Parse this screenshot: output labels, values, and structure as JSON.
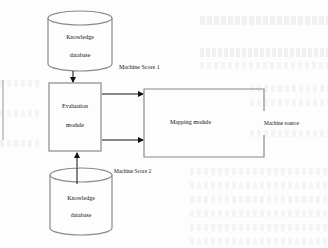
{
  "diagram": {
    "nodes": {
      "knowledge_db_top": {
        "line1": "Knowledge",
        "line2": "database",
        "shape": "cylinder"
      },
      "evaluation_module": {
        "line1": "Evaluation",
        "line2": "module",
        "shape": "rectangle"
      },
      "mapping_module": {
        "label": "Mapping module",
        "shape": "open-rectangle"
      },
      "knowledge_db_bottom": {
        "line1": "Knowledge",
        "line2": "database",
        "shape": "cylinder"
      }
    },
    "edge_labels": {
      "score1": "Machine Score 1",
      "score2": "Machine Score 2",
      "source": "Machine source"
    },
    "edges": [
      {
        "from": "knowledge_db_top",
        "to": "evaluation_module"
      },
      {
        "from": "knowledge_db_bottom",
        "to": "evaluation_module"
      },
      {
        "from": "evaluation_module",
        "to": "mapping_module",
        "label": "Machine Score 1"
      },
      {
        "from": "evaluation_module",
        "to": "mapping_module",
        "label": "Machine Score 2"
      }
    ],
    "colors": {
      "stroke": "#8a8a8a",
      "arrow": "#111111",
      "text": "#111111",
      "background": "#fdfdfd"
    }
  }
}
